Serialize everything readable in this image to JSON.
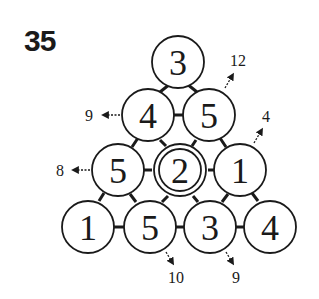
{
  "puzzle": {
    "number": "35",
    "rows": [
      [
        "3"
      ],
      [
        "4",
        "5"
      ],
      [
        "5",
        "2",
        "1"
      ],
      [
        "1",
        "5",
        "3",
        "4"
      ]
    ],
    "highlighted_cell": {
      "row": 2,
      "col": 1,
      "value": "2"
    },
    "clues": {
      "left_row2": "9",
      "left_row3": "8",
      "right_row1": "12",
      "right_row2": "4",
      "bottom_col1": "10",
      "bottom_col2": "9"
    }
  },
  "colors": {
    "ink": "#1a1a1a",
    "background": "#ffffff"
  }
}
